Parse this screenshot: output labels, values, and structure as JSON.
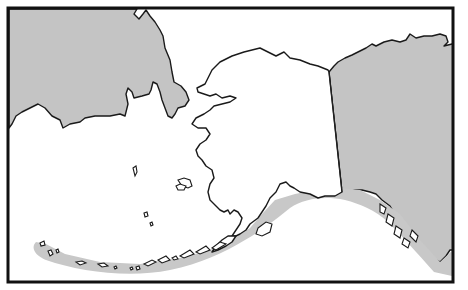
{
  "map": {
    "subject": "Alaska coastal distribution range map",
    "regions": [
      {
        "name": "Russia (Chukotka)",
        "fill": "#c4c4c4"
      },
      {
        "name": "Alaska",
        "fill": "#ffffff"
      },
      {
        "name": "Canada (Yukon / British Columbia)",
        "fill": "#c4c4c4"
      }
    ],
    "range": {
      "description": "Shaded range along the Aleutian Islands, Alaska Peninsula, Gulf of Alaska and Southeast Alaska coast",
      "fill": "#c8c8c8"
    },
    "colors": {
      "background": "#ffffff",
      "outline": "#1a1a1a",
      "frame": "#111111"
    }
  }
}
